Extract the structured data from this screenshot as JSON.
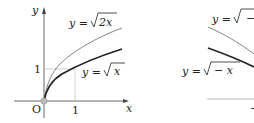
{
  "left_figure": {
    "y_axis_label": "y",
    "x_axis_label": "x",
    "origin_label": "O",
    "x_tick_label": "1",
    "y_tick_label": "1",
    "curve_upper": {
      "lhs": "y =",
      "radicand": "2x"
    },
    "curve_lower": {
      "lhs": "y =",
      "radicand": "x"
    }
  },
  "right_figure": {
    "curve_upper": {
      "lhs": "y =",
      "radicand": "−"
    },
    "curve_lower": {
      "lhs": "y =",
      "radicand": "− x"
    },
    "tick_label": "−"
  },
  "colors": {
    "axis": "#444444",
    "thin_curve": "#777777",
    "thick_curve": "#222222",
    "guide": "#bbbbbb",
    "origin_dot": "#bbbbbb"
  }
}
